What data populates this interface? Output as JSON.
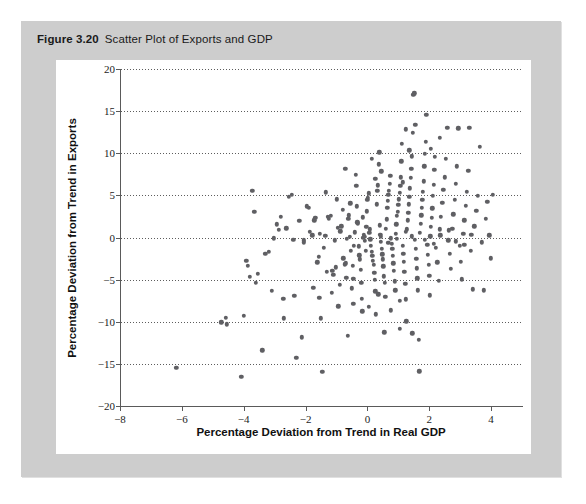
{
  "figure": {
    "label": "Figure 3.20",
    "title": "Scatter Plot of Exports and GDP",
    "panel_color": "#cdcdcd",
    "card_color": "#ffffff",
    "dot_color": "#5f5f63"
  },
  "chart_data": {
    "type": "scatter",
    "title": "Scatter Plot of Exports and GDP",
    "xlabel": "Percentage Deviation from Trend in Real GDP",
    "ylabel": "Percentage Deviation from Trend in Exports",
    "xlim": [
      -8,
      5
    ],
    "ylim": [
      -20,
      20
    ],
    "xticks": [
      -8,
      -6,
      -4,
      -2,
      0,
      2,
      4
    ],
    "xtick_labels": [
      "−8",
      "−6",
      "−4",
      "−2",
      "0",
      "2",
      "4"
    ],
    "yticks": [
      -20,
      -15,
      -10,
      -5,
      0,
      5,
      10,
      15,
      20
    ],
    "ytick_labels": [
      "−20",
      "−15",
      "−10",
      "−5",
      "0",
      "5",
      "10",
      "15",
      "20"
    ],
    "grid": "horizontal-dotted",
    "legend": null,
    "marker": "circle",
    "marker_size": 4.4,
    "points": [
      [
        -6.18,
        -15.45
      ],
      [
        -4.72,
        -10.05
      ],
      [
        -4.58,
        -9.55
      ],
      [
        -4.55,
        -10.3
      ],
      [
        -4.08,
        -16.5
      ],
      [
        -4.0,
        -9.3
      ],
      [
        -3.92,
        -2.8
      ],
      [
        -3.86,
        -3.35
      ],
      [
        -3.8,
        -4.65
      ],
      [
        -3.72,
        5.55
      ],
      [
        -3.66,
        3.05
      ],
      [
        -3.6,
        -5.4
      ],
      [
        -3.55,
        -4.3
      ],
      [
        -3.4,
        -13.4
      ],
      [
        -3.3,
        -1.9
      ],
      [
        -3.18,
        -1.7
      ],
      [
        -3.02,
        -0.1
      ],
      [
        -2.92,
        1.55
      ],
      [
        -2.86,
        0.9
      ],
      [
        -2.8,
        2.45
      ],
      [
        -2.72,
        -7.25
      ],
      [
        -2.7,
        -9.6
      ],
      [
        -2.62,
        1.1
      ],
      [
        -2.55,
        4.85
      ],
      [
        -2.45,
        5.1
      ],
      [
        -2.4,
        -0.25
      ],
      [
        -2.36,
        -6.9
      ],
      [
        -2.3,
        -14.3
      ],
      [
        -2.12,
        -11.85
      ],
      [
        -2.05,
        -0.35
      ],
      [
        -1.96,
        3.7
      ],
      [
        -1.9,
        3.55
      ],
      [
        -1.86,
        0.7
      ],
      [
        -1.78,
        0.25
      ],
      [
        -1.72,
        2.05
      ],
      [
        -1.68,
        2.35
      ],
      [
        -1.62,
        -2.95
      ],
      [
        -1.58,
        -2.3
      ],
      [
        -1.55,
        -7.15
      ],
      [
        -1.5,
        -9.6
      ],
      [
        -1.46,
        -15.95
      ],
      [
        -1.4,
        -1.25
      ],
      [
        -1.36,
        0.2
      ],
      [
        -1.32,
        -4.05
      ],
      [
        -1.28,
        2.45
      ],
      [
        -1.24,
        2.2
      ],
      [
        -1.18,
        2.6
      ],
      [
        -1.14,
        -3.95
      ],
      [
        -1.1,
        -4.4
      ],
      [
        -1.06,
        -0.35
      ],
      [
        -1.02,
        -3.55
      ],
      [
        -0.98,
        4.55
      ],
      [
        -0.94,
        -8.15
      ],
      [
        -0.9,
        -5.65
      ],
      [
        -0.88,
        0.75
      ],
      [
        -0.84,
        1.35
      ],
      [
        -0.8,
        3.3
      ],
      [
        -0.78,
        -2.45
      ],
      [
        -0.74,
        -3.2
      ],
      [
        -0.7,
        -3.05
      ],
      [
        -0.68,
        -4.8
      ],
      [
        -0.64,
        -11.7
      ],
      [
        -0.62,
        2.2
      ],
      [
        -0.6,
        2.65
      ],
      [
        -0.56,
        0.05
      ],
      [
        -0.54,
        -1.55
      ],
      [
        -0.5,
        -6.05
      ],
      [
        -0.48,
        -3.35
      ],
      [
        -0.46,
        -4.9
      ],
      [
        -0.44,
        -0.95
      ],
      [
        -0.4,
        0.6
      ],
      [
        -0.38,
        7.45
      ],
      [
        -0.36,
        6.15
      ],
      [
        -0.34,
        3.7
      ],
      [
        -0.32,
        1.8
      ],
      [
        -0.3,
        1.7
      ],
      [
        -0.28,
        -1.05
      ],
      [
        -0.26,
        -2.1
      ],
      [
        -0.24,
        -2.6
      ],
      [
        -0.22,
        -3.85
      ],
      [
        -0.2,
        -5.35
      ],
      [
        -0.18,
        -7.3
      ],
      [
        -0.16,
        -8.75
      ],
      [
        -0.14,
        2.4
      ],
      [
        -0.12,
        0.35
      ],
      [
        -0.1,
        0.1
      ],
      [
        -0.08,
        -0.4
      ],
      [
        -0.06,
        -1.55
      ],
      [
        -0.04,
        1.25
      ],
      [
        -0.02,
        3.1
      ],
      [
        0.0,
        4.45
      ],
      [
        0.02,
        4.7
      ],
      [
        0.04,
        5.25
      ],
      [
        0.06,
        0.55
      ],
      [
        0.08,
        0.95
      ],
      [
        0.1,
        -0.2
      ],
      [
        0.12,
        -0.95
      ],
      [
        0.14,
        -1.7
      ],
      [
        0.16,
        -2.2
      ],
      [
        0.18,
        -2.75
      ],
      [
        0.2,
        -3.25
      ],
      [
        0.22,
        -4.2
      ],
      [
        0.24,
        -5.0
      ],
      [
        0.26,
        -6.4
      ],
      [
        0.28,
        -9.1
      ],
      [
        0.3,
        3.95
      ],
      [
        0.32,
        5.55
      ],
      [
        0.34,
        6.2
      ],
      [
        0.36,
        8.7
      ],
      [
        0.38,
        10.1
      ],
      [
        0.4,
        1.45
      ],
      [
        0.42,
        0.35
      ],
      [
        0.44,
        -0.5
      ],
      [
        0.46,
        -1.35
      ],
      [
        0.48,
        -2.0
      ],
      [
        0.5,
        -2.6
      ],
      [
        0.52,
        -3.4
      ],
      [
        0.54,
        -4.6
      ],
      [
        0.56,
        -5.35
      ],
      [
        0.58,
        -7.05
      ],
      [
        0.6,
        1.0
      ],
      [
        0.62,
        2.15
      ],
      [
        0.64,
        3.55
      ],
      [
        0.66,
        4.35
      ],
      [
        0.68,
        5.05
      ],
      [
        0.7,
        5.55
      ],
      [
        0.72,
        6.35
      ],
      [
        0.74,
        7.35
      ],
      [
        0.76,
        -0.1
      ],
      [
        0.78,
        -0.75
      ],
      [
        0.8,
        -1.35
      ],
      [
        0.82,
        -2.15
      ],
      [
        0.84,
        -3.05
      ],
      [
        0.86,
        -3.95
      ],
      [
        0.88,
        -5.2
      ],
      [
        0.9,
        -6.25
      ],
      [
        0.92,
        0.45
      ],
      [
        0.94,
        1.55
      ],
      [
        0.96,
        2.55
      ],
      [
        0.98,
        3.05
      ],
      [
        1.0,
        3.85
      ],
      [
        1.02,
        4.55
      ],
      [
        1.04,
        5.3
      ],
      [
        1.06,
        6.1
      ],
      [
        1.08,
        7.15
      ],
      [
        1.1,
        9.05
      ],
      [
        1.12,
        11.1
      ],
      [
        1.14,
        -0.95
      ],
      [
        1.16,
        -1.9
      ],
      [
        1.18,
        -2.85
      ],
      [
        1.2,
        -4.05
      ],
      [
        1.22,
        -5.5
      ],
      [
        1.24,
        -7.35
      ],
      [
        1.26,
        -9.95
      ],
      [
        1.28,
        0.95
      ],
      [
        1.3,
        2.05
      ],
      [
        1.32,
        2.95
      ],
      [
        1.34,
        3.95
      ],
      [
        1.36,
        4.85
      ],
      [
        1.38,
        5.85
      ],
      [
        1.4,
        7.05
      ],
      [
        1.42,
        8.15
      ],
      [
        1.44,
        9.65
      ],
      [
        1.46,
        12.45
      ],
      [
        1.48,
        16.95
      ],
      [
        1.52,
        17.1
      ],
      [
        1.54,
        -0.25
      ],
      [
        1.56,
        -1.35
      ],
      [
        1.58,
        -2.55
      ],
      [
        1.6,
        -3.65
      ],
      [
        1.62,
        -4.85
      ],
      [
        1.64,
        -6.25
      ],
      [
        1.66,
        -12.15
      ],
      [
        1.68,
        -15.9
      ],
      [
        1.7,
        0.55
      ],
      [
        1.72,
        1.65
      ],
      [
        1.74,
        2.65
      ],
      [
        1.76,
        3.55
      ],
      [
        1.78,
        4.45
      ],
      [
        1.8,
        5.45
      ],
      [
        1.82,
        6.65
      ],
      [
        1.84,
        8.45
      ],
      [
        1.86,
        9.95
      ],
      [
        1.88,
        11.35
      ],
      [
        1.9,
        14.55
      ],
      [
        1.94,
        -0.85
      ],
      [
        1.96,
        -2.05
      ],
      [
        1.98,
        -3.25
      ],
      [
        2.0,
        -4.55
      ],
      [
        2.02,
        -6.85
      ],
      [
        2.04,
        0.15
      ],
      [
        2.06,
        1.25
      ],
      [
        2.08,
        2.35
      ],
      [
        2.1,
        3.45
      ],
      [
        2.12,
        4.95
      ],
      [
        2.14,
        6.25
      ],
      [
        2.16,
        8.05
      ],
      [
        2.18,
        9.55
      ],
      [
        2.22,
        -1.25
      ],
      [
        2.26,
        -2.95
      ],
      [
        2.3,
        -5.15
      ],
      [
        2.34,
        0.95
      ],
      [
        2.38,
        2.45
      ],
      [
        2.42,
        4.15
      ],
      [
        2.46,
        5.65
      ],
      [
        2.5,
        7.15
      ],
      [
        2.54,
        9.35
      ],
      [
        2.58,
        13.05
      ],
      [
        2.62,
        -0.35
      ],
      [
        2.66,
        -1.95
      ],
      [
        2.7,
        -3.75
      ],
      [
        2.74,
        1.05
      ],
      [
        2.78,
        2.75
      ],
      [
        2.82,
        4.45
      ],
      [
        2.86,
        6.35
      ],
      [
        2.9,
        8.45
      ],
      [
        2.94,
        12.95
      ],
      [
        2.98,
        -0.95
      ],
      [
        3.02,
        -2.85
      ],
      [
        3.06,
        -4.95
      ],
      [
        3.1,
        0.45
      ],
      [
        3.14,
        2.05
      ],
      [
        3.18,
        3.75
      ],
      [
        3.22,
        5.45
      ],
      [
        3.26,
        7.95
      ],
      [
        3.3,
        13.05
      ],
      [
        3.34,
        -1.55
      ],
      [
        3.4,
        -6.15
      ],
      [
        3.46,
        1.35
      ],
      [
        3.52,
        3.15
      ],
      [
        3.58,
        4.95
      ],
      [
        3.64,
        10.75
      ],
      [
        3.7,
        -0.55
      ],
      [
        3.76,
        -6.25
      ],
      [
        3.82,
        2.25
      ],
      [
        3.88,
        4.25
      ],
      [
        3.94,
        0.25
      ],
      [
        4.0,
        -2.45
      ],
      [
        4.05,
        5.05
      ],
      [
        -3.1,
        -6.3
      ],
      [
        -2.2,
        1.95
      ],
      [
        -1.34,
        5.35
      ],
      [
        -0.72,
        8.15
      ],
      [
        0.15,
        9.35
      ],
      [
        0.55,
        -11.25
      ],
      [
        1.05,
        -10.85
      ],
      [
        1.25,
        12.85
      ],
      [
        2.35,
        11.85
      ],
      [
        -0.95,
        1.15
      ],
      [
        -0.55,
        4.05
      ],
      [
        0.25,
        6.95
      ],
      [
        0.45,
        7.85
      ],
      [
        1.15,
        6.55
      ],
      [
        1.35,
        10.35
      ],
      [
        1.55,
        13.35
      ],
      [
        2.05,
        10.55
      ],
      [
        -1.75,
        -5.95
      ],
      [
        -1.15,
        -6.55
      ],
      [
        -0.45,
        -7.85
      ],
      [
        0.05,
        -8.25
      ],
      [
        0.35,
        -6.75
      ],
      [
        0.75,
        -8.65
      ],
      [
        1.05,
        -7.55
      ],
      [
        1.45,
        -11.35
      ],
      [
        -0.66,
        -0.15
      ],
      [
        -0.14,
        -0.05
      ],
      [
        0.44,
        0.05
      ],
      [
        0.96,
        -0.15
      ],
      [
        1.44,
        0.15
      ],
      [
        1.86,
        -0.25
      ],
      [
        2.36,
        0.25
      ],
      [
        2.86,
        -0.45
      ],
      [
        3.36,
        0.35
      ],
      [
        -2.06,
        -0.55
      ],
      [
        -1.54,
        0.45
      ],
      [
        0.68,
        -0.65
      ],
      [
        1.24,
        0.65
      ],
      [
        2.14,
        -0.75
      ],
      [
        2.64,
        0.85
      ],
      [
        3.14,
        -0.85
      ]
    ]
  }
}
